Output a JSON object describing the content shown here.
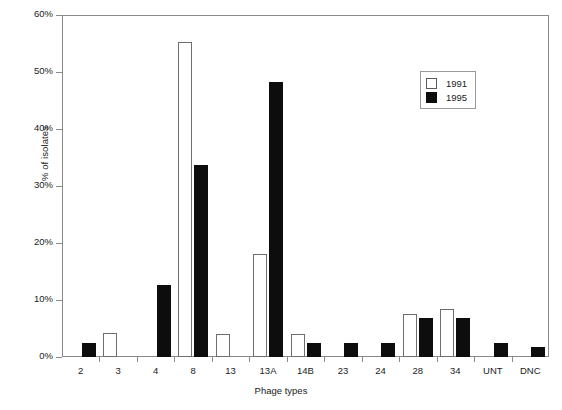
{
  "chart_data": {
    "type": "bar",
    "title": "",
    "xlabel": "Phage types",
    "ylabel": "% of isolates",
    "ylim": [
      0,
      60
    ],
    "yticks": [
      "0%",
      "10%",
      "20%",
      "30%",
      "40%",
      "50%",
      "60%"
    ],
    "ytick_values": [
      0,
      10,
      20,
      30,
      40,
      50,
      60
    ],
    "grid": false,
    "legend_position": "upper right",
    "categories": [
      "2",
      "3",
      "4",
      "8",
      "13",
      "13A",
      "14B",
      "23",
      "24",
      "28",
      "34",
      "UNT",
      "DNC"
    ],
    "series": [
      {
        "name": "1991",
        "color": "#ffffff",
        "edge_color": "#6e6e6e",
        "values": [
          0,
          4.2,
          0,
          55.3,
          4.0,
          18.0,
          4.0,
          0,
          0,
          7.5,
          8.5,
          0,
          0
        ]
      },
      {
        "name": "1995",
        "color": "#0d0d0d",
        "edge_color": "#0d0d0d",
        "values": [
          2.5,
          0,
          12.7,
          33.6,
          0,
          48.3,
          2.5,
          2.5,
          2.5,
          6.8,
          6.8,
          2.5,
          1.8
        ]
      }
    ]
  },
  "legend": {
    "entries": [
      {
        "label": "1991"
      },
      {
        "label": "1995"
      }
    ]
  }
}
